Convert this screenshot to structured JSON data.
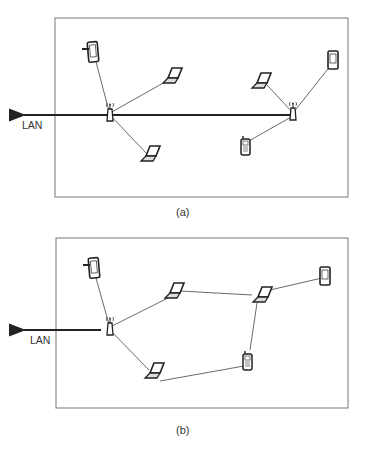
{
  "diagrams": [
    {
      "id": "a",
      "caption": "(a)",
      "lan_label": "LAN",
      "description": "Infrastructure mode: two access points connected by wired LAN backbone, each serving wireless devices",
      "nodes": [
        {
          "name": "access-point-1",
          "type": "access-point"
        },
        {
          "name": "access-point-2",
          "type": "access-point"
        },
        {
          "name": "pda-1",
          "type": "pda"
        },
        {
          "name": "laptop-1",
          "type": "laptop"
        },
        {
          "name": "laptop-2",
          "type": "laptop"
        },
        {
          "name": "laptop-3",
          "type": "laptop"
        },
        {
          "name": "pda-2",
          "type": "pda"
        },
        {
          "name": "cellphone-1",
          "type": "cellphone"
        }
      ]
    },
    {
      "id": "b",
      "caption": "(b)",
      "lan_label": "LAN",
      "description": "Mesh/multi-hop mode: single access point connected to LAN, devices relay via each other",
      "nodes": [
        {
          "name": "access-point-1",
          "type": "access-point"
        },
        {
          "name": "pda-1",
          "type": "pda"
        },
        {
          "name": "laptop-1",
          "type": "laptop"
        },
        {
          "name": "laptop-2",
          "type": "laptop"
        },
        {
          "name": "laptop-3",
          "type": "laptop"
        },
        {
          "name": "pda-2",
          "type": "pda"
        },
        {
          "name": "cellphone-1",
          "type": "cellphone"
        }
      ]
    }
  ],
  "colors": {
    "frame": "#777777",
    "link": "#444444",
    "backbone": "#222222",
    "screen": "#dddddd"
  }
}
